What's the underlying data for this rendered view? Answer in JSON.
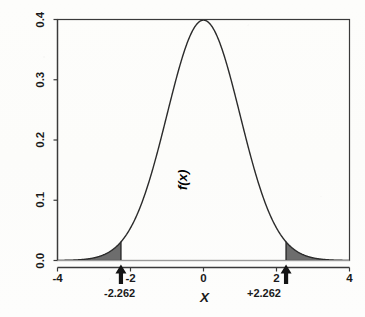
{
  "figure": {
    "background_color": "#fdfdfc",
    "curve_color": "#2b2b2b",
    "shade_color": "#6d6d6d",
    "axis_color": "#3a3a3a"
  },
  "axes": {
    "x": {
      "title": "X",
      "ticks": [
        {
          "value": -4,
          "label": "-4"
        },
        {
          "value": -2,
          "label": "-2"
        },
        {
          "value": 0,
          "label": "0"
        },
        {
          "value": 2,
          "label": "2"
        },
        {
          "value": 4,
          "label": "4"
        }
      ],
      "range": [
        -4,
        4
      ]
    },
    "y": {
      "title": "f(x)",
      "ticks": [
        {
          "value": 0.0,
          "label": "0.0"
        },
        {
          "value": 0.1,
          "label": "0.1"
        },
        {
          "value": 0.2,
          "label": "0.2"
        },
        {
          "value": 0.3,
          "label": "0.3"
        },
        {
          "value": 0.4,
          "label": "0.4"
        }
      ],
      "range": [
        0.0,
        0.4
      ]
    }
  },
  "annotations": [
    {
      "name": "left-critical-value",
      "label": "-2.262",
      "x": -2.262,
      "marker": "up-arrow"
    },
    {
      "name": "right-critical-value",
      "label": "+2.262",
      "x": 2.262,
      "marker": "up-arrow"
    }
  ],
  "chart_data": {
    "type": "line",
    "title": "",
    "subtitle": "",
    "xlabel": "X",
    "ylabel": "f(x)",
    "xlim": [
      -4,
      4
    ],
    "ylim": [
      0.0,
      0.4
    ],
    "grid": false,
    "legend": null,
    "distribution": "standard normal density",
    "peak": {
      "x": 0,
      "y": 0.3989
    },
    "shaded_regions": [
      {
        "name": "left-tail",
        "from": -4,
        "to": -2.262,
        "fill": "#6d6d6d"
      },
      {
        "name": "right-tail",
        "from": 2.262,
        "to": 4,
        "fill": "#6d6d6d"
      }
    ],
    "critical_values": [
      -2.262,
      2.262
    ],
    "x": [
      -4.0,
      -3.8,
      -3.6,
      -3.4,
      -3.2,
      -3.0,
      -2.8,
      -2.6,
      -2.4,
      -2.262,
      -2.2,
      -2.0,
      -1.8,
      -1.6,
      -1.4,
      -1.2,
      -1.0,
      -0.8,
      -0.6,
      -0.4,
      -0.2,
      0.0,
      0.2,
      0.4,
      0.6,
      0.8,
      1.0,
      1.2,
      1.4,
      1.6,
      1.8,
      2.0,
      2.2,
      2.262,
      2.4,
      2.6,
      2.8,
      3.0,
      3.2,
      3.4,
      3.6,
      3.8,
      4.0
    ],
    "y": [
      0.0001,
      0.0003,
      0.0006,
      0.0012,
      0.0024,
      0.0044,
      0.0079,
      0.0136,
      0.0224,
      0.031,
      0.0355,
      0.054,
      0.079,
      0.1109,
      0.1497,
      0.1942,
      0.242,
      0.2897,
      0.3332,
      0.3683,
      0.391,
      0.3989,
      0.391,
      0.3683,
      0.3332,
      0.2897,
      0.242,
      0.1942,
      0.1497,
      0.1109,
      0.079,
      0.054,
      0.0355,
      0.031,
      0.0224,
      0.0136,
      0.0079,
      0.0044,
      0.0024,
      0.0012,
      0.0006,
      0.0003,
      0.0001
    ]
  }
}
